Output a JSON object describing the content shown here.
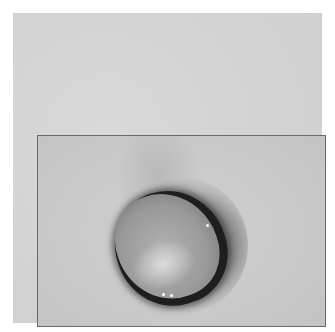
{
  "image": {
    "description": "Grayscale clinical photograph of a round protruding stoma-like lesion on skin, shown inside a bordered frame on a light gray panel",
    "colors": {
      "page_background": "#ffffff",
      "panel": "#d4d4d4",
      "frame_border": "#6a6a6a",
      "skin": "#c9c9c9",
      "lesion_rim": "#1e1e1e",
      "lesion_body": "#9a9a9a"
    }
  }
}
